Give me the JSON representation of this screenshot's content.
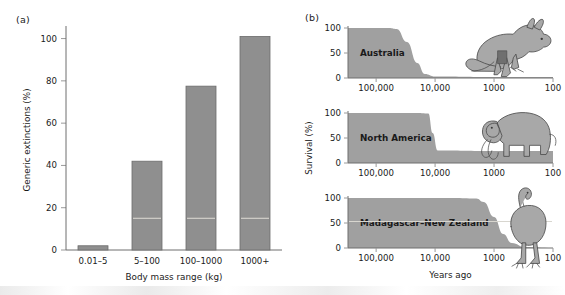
{
  "figure": {
    "panel_a_label": "(a)",
    "panel_b_label": "(b)"
  },
  "chart_data": [
    {
      "type": "bar",
      "panel": "(a)",
      "title": "",
      "xlabel": "Body mass range (kg)",
      "ylabel": "Generic extinctions (%)",
      "categories": [
        "0.01–5",
        "5–100",
        "100–1000",
        "1000+"
      ],
      "values": [
        2,
        42,
        77.5,
        101
      ],
      "ylim": [
        0,
        105
      ],
      "yticks": [
        0,
        20,
        40,
        60,
        80,
        100
      ],
      "ytick_labels": [
        "0",
        "20",
        "40",
        "60",
        "80",
        "100"
      ],
      "grid": false,
      "legend": "none",
      "bar_color": "#8f8f8f"
    },
    {
      "type": "area",
      "panel": "(b)",
      "title": "",
      "xlabel": "Years ago",
      "ylabel": "Survival (%)",
      "xscale": "log-reversed",
      "xticks": [
        100000,
        10000,
        1000,
        100
      ],
      "xtick_labels": [
        "100,000",
        "10,000",
        "1000",
        "100"
      ],
      "ylim": [
        0,
        100
      ],
      "yticks": [
        0,
        50,
        100
      ],
      "ytick_labels": [
        "0",
        "50",
        "100"
      ],
      "grid": false,
      "legend": "none",
      "fill_color": "#a0a0a0",
      "series": [
        {
          "name": "Australia",
          "icon": "kangaroo-illustration",
          "x": [
            200000,
            60000,
            45000,
            30000,
            20000,
            15000,
            10000,
            1000,
            100
          ],
          "y": [
            100,
            100,
            98,
            72,
            30,
            8,
            3,
            2,
            2
          ]
        },
        {
          "name": "North America",
          "icon": "mammoth-illustration",
          "x": [
            200000,
            20000,
            13000,
            11000,
            9000,
            1000,
            100
          ],
          "y": [
            100,
            100,
            99,
            60,
            25,
            24,
            24
          ]
        },
        {
          "name": "Madagascar–New Zealand",
          "icon": "moa-illustration",
          "x": [
            200000,
            5000,
            2000,
            1500,
            1000,
            700,
            500,
            300,
            100
          ],
          "y": [
            100,
            100,
            99,
            92,
            62,
            28,
            10,
            2,
            0
          ]
        }
      ]
    }
  ]
}
